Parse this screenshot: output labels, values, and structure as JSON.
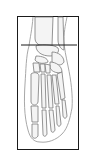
{
  "diagram": {
    "frame": {
      "stroke": "#1a1a1a"
    },
    "cut_line": {
      "label": "",
      "stroke": "#1a1a1a"
    },
    "colors": {
      "bone_outline": "#7a7a7a",
      "soft_tissue": "#a8a8a8",
      "bone_fill": "#f4f4f4",
      "background": "#ffffff"
    }
  }
}
